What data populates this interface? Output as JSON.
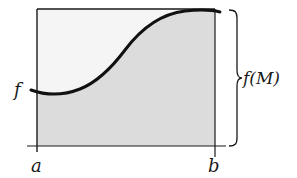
{
  "diagram": {
    "labels": {
      "function": "f",
      "x_left": "a",
      "x_right": "b",
      "brace_label": "f(M)"
    },
    "colors": {
      "rectangle_fill": "#f5f5f5",
      "area_fill": "#dcdcdc",
      "stroke": "#1a1a1a"
    }
  }
}
